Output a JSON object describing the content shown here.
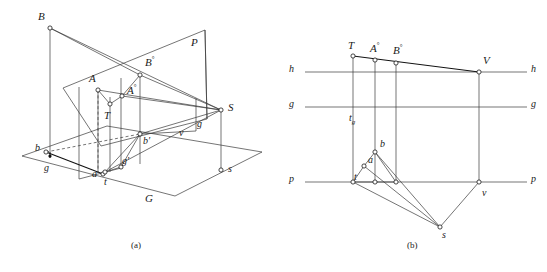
{
  "figure": {
    "caption_a": "(a)",
    "caption_b": "(b)"
  },
  "colors": {
    "line": "#3a3a3a",
    "line_strong": "#111111",
    "dashed": "#3a3a3a",
    "text": "#1a1a1a",
    "background": "#ffffff"
  },
  "panel_a": {
    "name": "axonometric-view",
    "plane_labels": {
      "picture_plane": "P",
      "ground_plane": "G"
    },
    "points": [
      {
        "id": "B",
        "label": "B",
        "case": "upper"
      },
      {
        "id": "A",
        "label": "A",
        "case": "upper"
      },
      {
        "id": "Ao",
        "label": "A",
        "sup": "°",
        "case": "upper"
      },
      {
        "id": "Bo",
        "label": "B",
        "sup": "°",
        "case": "upper"
      },
      {
        "id": "T",
        "label": "T",
        "case": "upper"
      },
      {
        "id": "S",
        "label": "S",
        "case": "upper"
      },
      {
        "id": "a",
        "label": "a",
        "case": "lower"
      },
      {
        "id": "b",
        "label": "b",
        "case": "lower"
      },
      {
        "id": "bp",
        "label": "b′",
        "case": "lower"
      },
      {
        "id": "gp",
        "label": "g′",
        "case": "lower"
      },
      {
        "id": "g1",
        "label": "g",
        "case": "lower"
      },
      {
        "id": "g2",
        "label": "g",
        "case": "lower"
      },
      {
        "id": "t",
        "label": "t",
        "case": "lower"
      },
      {
        "id": "v",
        "label": "v",
        "case": "lower"
      },
      {
        "id": "s",
        "label": "s",
        "case": "lower"
      }
    ]
  },
  "panel_b": {
    "name": "orthographic-construction",
    "axis_lines": [
      {
        "id": "h",
        "left_label": "h",
        "right_label": "h",
        "meaning": "horizon-line"
      },
      {
        "id": "g",
        "left_label": "g",
        "right_label": "g",
        "meaning": "ground-level-line"
      },
      {
        "id": "p",
        "left_label": "p",
        "right_label": "p",
        "meaning": "picture-plane-trace"
      }
    ],
    "trace_label": {
      "base": "t",
      "sub": "g"
    },
    "points": [
      {
        "id": "T",
        "label": "T",
        "case": "upper"
      },
      {
        "id": "Ao",
        "label": "A",
        "sup": "°",
        "case": "upper"
      },
      {
        "id": "Bo",
        "label": "B",
        "sup": "°",
        "case": "upper"
      },
      {
        "id": "V",
        "label": "V",
        "case": "upper"
      },
      {
        "id": "a",
        "label": "a",
        "case": "lower"
      },
      {
        "id": "b",
        "label": "b",
        "case": "lower"
      },
      {
        "id": "t",
        "label": "t",
        "case": "lower"
      },
      {
        "id": "v",
        "label": "v",
        "case": "lower"
      },
      {
        "id": "s",
        "label": "s",
        "case": "lower"
      }
    ]
  }
}
